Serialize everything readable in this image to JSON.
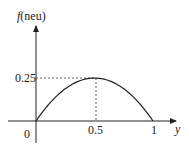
{
  "chart_data": {
    "type": "line",
    "title": "",
    "xlabel": "y",
    "ylabel_func": "f",
    "ylabel_arg": "(neu)",
    "x": [
      0,
      0.1,
      0.2,
      0.3,
      0.4,
      0.5,
      0.6,
      0.7,
      0.8,
      0.9,
      1
    ],
    "series": [
      {
        "name": "f(neu)",
        "values": [
          0,
          0.09,
          0.16,
          0.21,
          0.24,
          0.25,
          0.24,
          0.21,
          0.16,
          0.09,
          0
        ]
      }
    ],
    "xticks": [
      "0",
      "0.5",
      "1"
    ],
    "yticks": [
      "0.25"
    ],
    "annotations": [
      "dashed guide from (0.5, 0.25) to axes"
    ],
    "xlim": [
      0,
      1
    ],
    "ylim": [
      0,
      0.25
    ],
    "grid": false,
    "legend": "none"
  }
}
